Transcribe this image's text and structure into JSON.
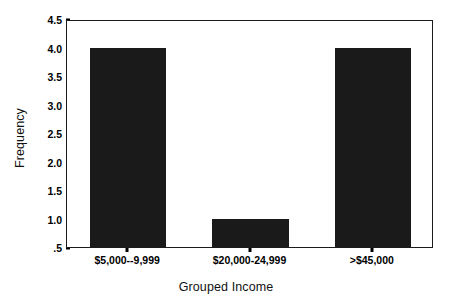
{
  "chart_data": {
    "type": "bar",
    "title": "",
    "subtitle": "",
    "xlabel": "Grouped Income",
    "ylabel": "Frequency",
    "categories": [
      "$5,000--9,999",
      "$20,000-24,999",
      ">$45,000"
    ],
    "values": [
      4.0,
      1.0,
      4.0
    ],
    "series": [
      {
        "name": "Frequency",
        "values": [
          4.0,
          1.0,
          4.0
        ]
      }
    ],
    "ylim": [
      0.5,
      4.5
    ],
    "ytick_values": [
      4.5,
      4.0,
      3.5,
      3.0,
      2.5,
      2.0,
      1.5,
      1.0,
      0.5
    ],
    "ytick_labels": [
      "4.5",
      "4.0",
      "3.5",
      "3.0",
      "2.5",
      "2.0",
      "1.5",
      "1.0",
      ".5"
    ],
    "grid": false,
    "legend": false,
    "legend_position": "none",
    "bar_color": "#1a1a1a",
    "background_color": "#ffffff",
    "axis_color": "#1b1b1b",
    "annotations": []
  }
}
